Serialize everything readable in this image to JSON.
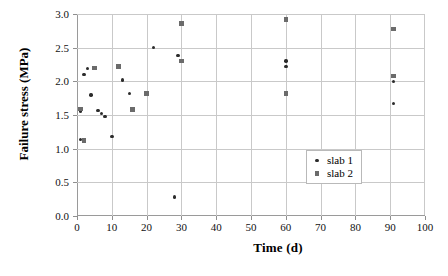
{
  "chart_data": {
    "type": "scatter",
    "title": "",
    "xlabel": "Time (d)",
    "ylabel": "Failure stress (MPa)",
    "xlim": [
      0,
      100
    ],
    "ylim": [
      0,
      3.0
    ],
    "xticks": [
      0,
      10,
      20,
      30,
      40,
      50,
      60,
      70,
      80,
      90,
      100
    ],
    "xtick_labels": [
      "0",
      "10",
      "20",
      "30",
      "40",
      "50",
      "60",
      "70",
      "80",
      "90",
      "100"
    ],
    "yticks": [
      0.0,
      0.5,
      1.0,
      1.5,
      2.0,
      2.5,
      3.0
    ],
    "ytick_labels": [
      "0.0",
      "0.5",
      "1.0",
      "1.5",
      "2.0",
      "2.5",
      "3.0"
    ],
    "grid": true,
    "legend_position": "center-right",
    "series": [
      {
        "name": "slab 1",
        "marker": "dot",
        "color": "#2b2b2b",
        "points": [
          [
            1,
            1.56
          ],
          [
            1,
            1.14
          ],
          [
            2,
            2.1
          ],
          [
            3,
            2.19
          ],
          [
            4,
            1.8
          ],
          [
            6,
            1.57
          ],
          [
            7,
            1.52
          ],
          [
            8,
            1.48
          ],
          [
            10,
            1.18
          ],
          [
            13,
            2.02
          ],
          [
            15,
            1.82
          ],
          [
            22,
            2.5
          ],
          [
            28,
            0.28
          ],
          [
            29,
            2.38
          ],
          [
            60,
            2.3
          ],
          [
            60,
            2.22
          ],
          [
            91,
            2.0
          ],
          [
            91,
            1.67
          ]
        ]
      },
      {
        "name": "slab 2",
        "marker": "square",
        "color": "#6b6b6b",
        "points": [
          [
            1,
            1.59
          ],
          [
            2,
            1.12
          ],
          [
            5,
            2.2
          ],
          [
            12,
            2.22
          ],
          [
            16,
            1.58
          ],
          [
            20,
            1.82
          ],
          [
            30,
            2.86
          ],
          [
            30,
            2.3
          ],
          [
            60,
            2.92
          ],
          [
            60,
            1.82
          ],
          [
            91,
            2.78
          ],
          [
            91,
            2.08
          ]
        ]
      }
    ]
  },
  "legend": {
    "entries": [
      {
        "label": "slab 1",
        "marker": "dot"
      },
      {
        "label": "slab 2",
        "marker": "square"
      }
    ]
  },
  "colors": {
    "slab1": "#2b2b2b",
    "slab2": "#6b6b6b",
    "grid": "#c9c9c9",
    "axis": "#8f8f8f",
    "background": "#ffffff"
  },
  "caption": ""
}
